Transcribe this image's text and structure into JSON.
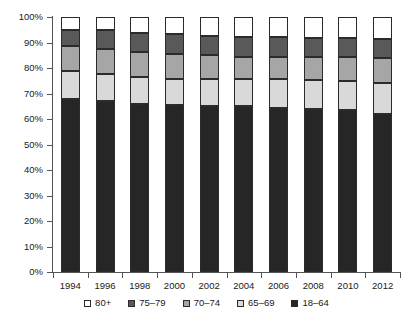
{
  "chart_data": {
    "type": "bar",
    "stacked": true,
    "stack_total": 100,
    "title": "",
    "subtitle": "",
    "xlabel": "",
    "ylabel": "",
    "categories": [
      "1994",
      "1996",
      "1998",
      "2000",
      "2002",
      "2004",
      "2006",
      "2008",
      "2010",
      "2012"
    ],
    "ylim": [
      0,
      100
    ],
    "ytick_labels": [
      "0%",
      "10%",
      "20%",
      "30%",
      "40%",
      "50%",
      "60%",
      "70%",
      "80%",
      "90%",
      "100%"
    ],
    "ytick_values": [
      0,
      10,
      20,
      30,
      40,
      50,
      60,
      70,
      80,
      90,
      100
    ],
    "grid": false,
    "legend_position": "bottom",
    "value_unit": "percent",
    "series": [
      {
        "name": "18-64",
        "color": "#262626",
        "values": [
          68.0,
          67.2,
          66.0,
          65.5,
          65.0,
          65.0,
          64.5,
          64.0,
          63.5,
          62.0
        ]
      },
      {
        "name": "65-69",
        "color": "#d9d9d9",
        "values": [
          10.8,
          10.3,
          10.5,
          10.0,
          10.5,
          10.5,
          11.0,
          11.2,
          11.5,
          12.0
        ]
      },
      {
        "name": "70-74",
        "color": "#a6a6a6",
        "values": [
          9.7,
          10.0,
          9.7,
          10.0,
          9.5,
          9.0,
          8.8,
          9.0,
          9.2,
          10.0
        ]
      },
      {
        "name": "75-79",
        "color": "#595959",
        "values": [
          6.3,
          7.3,
          7.6,
          8.0,
          7.7,
          7.8,
          7.7,
          7.6,
          7.5,
          7.5
        ]
      },
      {
        "name": "80+",
        "color": "#ffffff",
        "values": [
          5.2,
          5.2,
          6.2,
          6.5,
          7.3,
          7.7,
          8.0,
          8.2,
          8.3,
          8.5
        ]
      }
    ],
    "cumulative_tops": {
      "18-64": [
        68.0,
        67.2,
        66.0,
        65.5,
        65.0,
        65.0,
        64.5,
        64.0,
        63.5,
        62.0
      ],
      "65-69": [
        78.8,
        77.5,
        76.5,
        75.5,
        75.5,
        75.5,
        75.5,
        75.2,
        75.0,
        74.0
      ],
      "70-74": [
        88.5,
        87.5,
        86.2,
        85.5,
        85.0,
        84.5,
        84.3,
        84.2,
        84.2,
        84.0
      ],
      "75-79": [
        94.8,
        94.8,
        93.8,
        93.5,
        92.7,
        92.3,
        92.0,
        91.8,
        91.7,
        91.5
      ],
      "80+": [
        100.0,
        100.0,
        100.0,
        100.0,
        100.0,
        100.0,
        100.0,
        100.0,
        100.0,
        100.0
      ]
    }
  },
  "legend": {
    "items": [
      {
        "label": "80+",
        "color": "#ffffff"
      },
      {
        "label": "75–79",
        "color": "#595959"
      },
      {
        "label": "70–74",
        "color": "#a6a6a6"
      },
      {
        "label": "65–69",
        "color": "#d9d9d9"
      },
      {
        "label": "18–64",
        "color": "#262626"
      }
    ]
  },
  "colors": {
    "axis": "#555555",
    "segment_border": "#2b2b2b",
    "text": "#1a1a1a",
    "background": "#ffffff"
  }
}
